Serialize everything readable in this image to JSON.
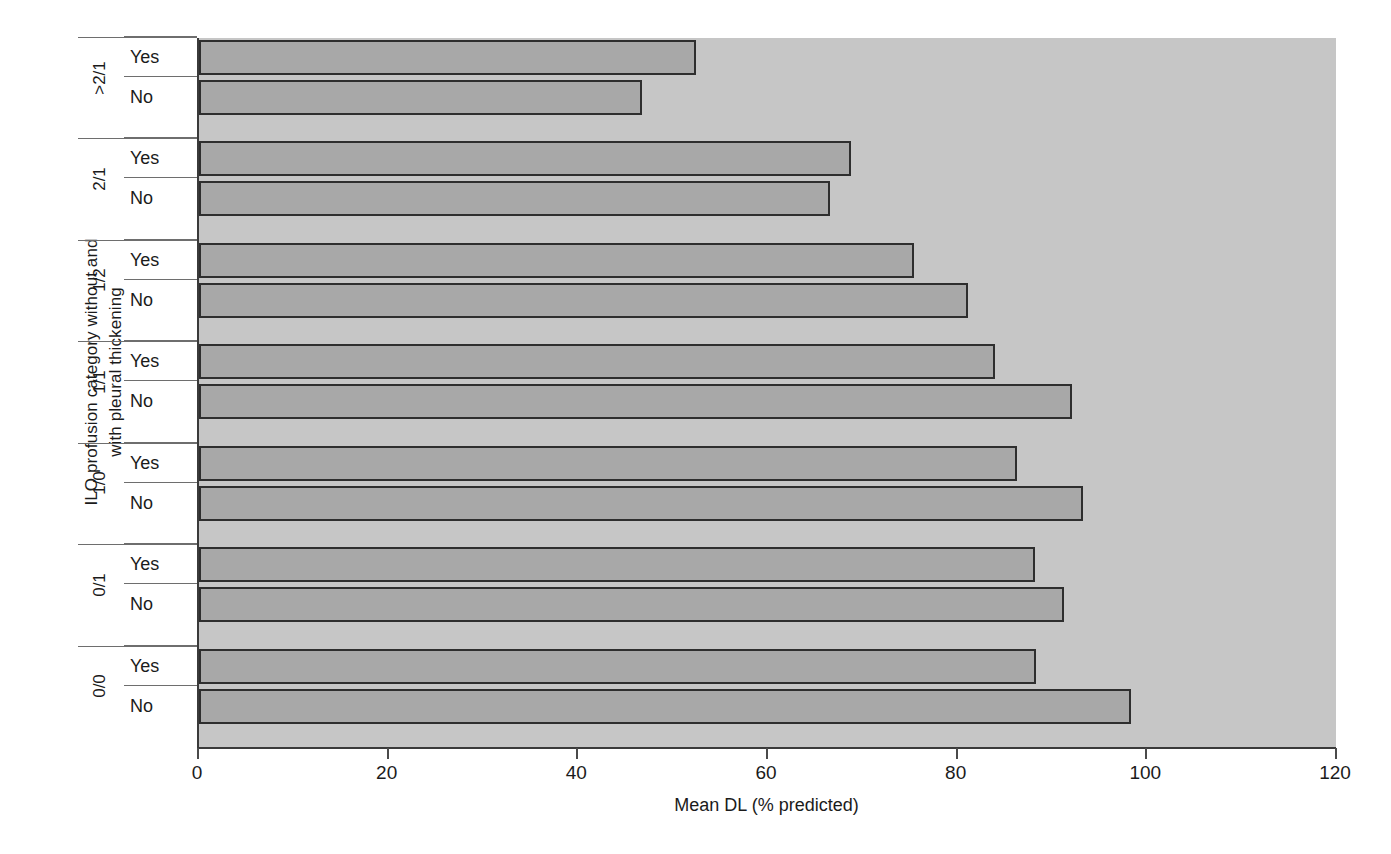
{
  "chart_data": {
    "type": "bar",
    "orientation": "horizontal",
    "title": "",
    "xlabel": "Mean DL (% predicted)",
    "ylabel": "ILO profusion category without and with pleural thickening",
    "xlim": [
      0,
      120
    ],
    "xticks": [
      0,
      20,
      40,
      60,
      80,
      100,
      120
    ],
    "xtick_labels": [
      "0",
      "20",
      "40",
      "60",
      "80",
      "100",
      "120"
    ],
    "grid": false,
    "legend": "none",
    "group_label": "ILO profusion category",
    "sub_label": "Pleural thickening",
    "categories": [
      ">2/1",
      "2/1",
      "1/2",
      "1/1",
      "1/0",
      "0/1",
      "0/0"
    ],
    "subcategories": [
      "Yes",
      "No"
    ],
    "bars": [
      {
        "category": ">2/1",
        "sub": "Yes",
        "value": 52.4
      },
      {
        "category": ">2/1",
        "sub": "No",
        "value": 46.7
      },
      {
        "category": "2/1",
        "sub": "Yes",
        "value": 68.7
      },
      {
        "category": "2/1",
        "sub": "No",
        "value": 66.5
      },
      {
        "category": "1/2",
        "sub": "Yes",
        "value": 75.4
      },
      {
        "category": "1/2",
        "sub": "No",
        "value": 81.1
      },
      {
        "category": "1/1",
        "sub": "Yes",
        "value": 83.9
      },
      {
        "category": "1/1",
        "sub": "No",
        "value": 92.1
      },
      {
        "category": "1/0",
        "sub": "Yes",
        "value": 86.3
      },
      {
        "category": "1/0",
        "sub": "No",
        "value": 93.2
      },
      {
        "category": "0/1",
        "sub": "Yes",
        "value": 88.2
      },
      {
        "category": "0/1",
        "sub": "No",
        "value": 91.2
      },
      {
        "category": "0/0",
        "sub": "Yes",
        "value": 88.3
      },
      {
        "category": "0/0",
        "sub": "No",
        "value": 98.3
      }
    ],
    "series": [
      {
        "name": "Yes",
        "values": [
          52.4,
          68.7,
          75.4,
          83.9,
          86.3,
          88.2,
          88.3
        ]
      },
      {
        "name": "No",
        "values": [
          46.7,
          66.5,
          81.1,
          92.1,
          93.2,
          91.2,
          98.3
        ]
      }
    ],
    "colors": {
      "bar_fill": "#a8a8a8",
      "bar_border": "#2e2e2e",
      "plot_background": "#c6c6c6",
      "axis": "#3a3a3a",
      "text": "#1b1b1b",
      "figure_background": "#ffffff"
    }
  },
  "axes": {
    "y_title_line1": "ILO profusion category without and",
    "y_title_line2": "with pleural thickening",
    "x_title": "Mean DL (% predicted)"
  }
}
